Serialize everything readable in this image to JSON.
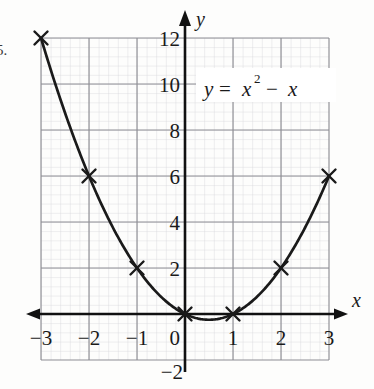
{
  "figure": {
    "exercise_number": "5.",
    "equation_label": "y = x² − x",
    "equation_parts": {
      "lhs": "y",
      "equals": "=",
      "base": "x",
      "exponent": "2",
      "minus": "−",
      "term": "x"
    },
    "axis_labels": {
      "x": "x",
      "y": "y"
    }
  },
  "colors": {
    "curve": "#1a1a1a",
    "axis": "#111111",
    "major_grid": "#8e8e94",
    "minor_grid": "#d4d4d8",
    "text": "#1a1a1a",
    "label_background": "#ffffff",
    "page_background": "#fdfdfc"
  },
  "ticks": {
    "x": [
      "−3",
      "−2",
      "−1",
      "0",
      "1",
      "2",
      "3"
    ],
    "y": [
      "−2",
      "0",
      "2",
      "4",
      "6",
      "8",
      "10",
      "12"
    ]
  },
  "chart_data": {
    "type": "line",
    "title": "",
    "subtitle": "",
    "xlabel": "x",
    "ylabel": "y",
    "equation": "y = x^2 - x",
    "xlim": [
      -3,
      3
    ],
    "ylim": [
      -2,
      12
    ],
    "grid": true,
    "grid_major_x_step": 1,
    "grid_major_y_step": 2,
    "grid_minor_subdivisions": 5,
    "legend": "none",
    "annotations": [
      {
        "text": "y = x² − x",
        "x": 0.55,
        "y": 10
      }
    ],
    "series": [
      {
        "name": "y = x^2 - x",
        "marker": "x-cross",
        "plotted_points": {
          "x": [
            -3,
            -2,
            -1,
            0,
            1,
            2,
            3
          ],
          "y": [
            12,
            6,
            2,
            0,
            0,
            2,
            6
          ]
        },
        "vertex": {
          "x": 0.5,
          "y": -0.25
        },
        "roots": [
          0,
          1
        ]
      }
    ]
  }
}
